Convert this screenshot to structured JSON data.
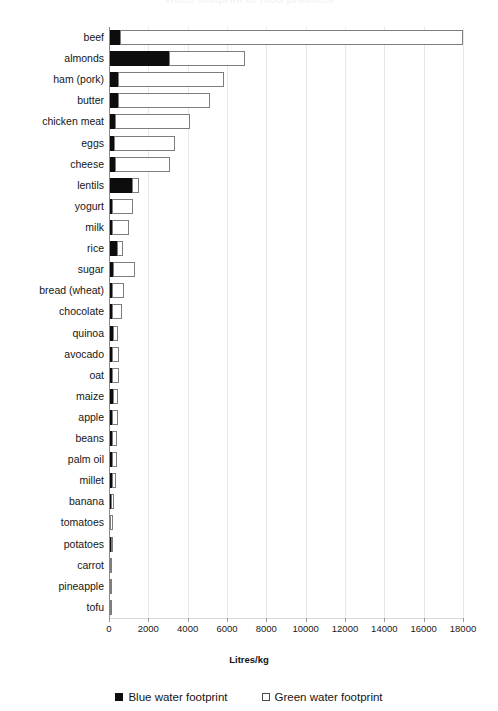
{
  "chart_data": {
    "type": "bar",
    "orientation": "horizontal",
    "stacked": true,
    "title": "Water footprint of food products",
    "xlabel": "Litres/kg",
    "ylabel": "",
    "xlim": [
      0,
      18000
    ],
    "xticks": [
      0,
      2000,
      4000,
      6000,
      8000,
      10000,
      12000,
      14000,
      16000,
      18000
    ],
    "xtick_labels": [
      "0",
      "2000",
      "4000",
      "6000",
      "8000",
      "10000",
      "12000",
      "14000",
      "16000",
      "18000"
    ],
    "grid": "vertical",
    "legend_position": "bottom",
    "categories": [
      "beef",
      "almonds",
      "ham (pork)",
      "butter",
      "chicken meat",
      "eggs",
      "cheese",
      "lentils",
      "yogurt",
      "milk",
      "rice",
      "sugar",
      "bread (wheat)",
      "chocolate",
      "quinoa",
      "avocado",
      "oat",
      "maize",
      "apple",
      "beans",
      "palm oil",
      "millet",
      "banana",
      "tomatoes",
      "potatoes",
      "carrot",
      "pineapple",
      "tofu"
    ],
    "series": [
      {
        "name": "Blue water footprint",
        "color": "#0d0d0d",
        "style": "filled",
        "values": [
          550,
          3050,
          460,
          470,
          320,
          240,
          280,
          1180,
          160,
          140,
          390,
          190,
          140,
          130,
          190,
          160,
          130,
          190,
          130,
          160,
          170,
          150,
          100,
          60,
          90,
          70,
          40,
          30
        ]
      },
      {
        "name": "Green water footprint",
        "color": "#ffffff",
        "style": "open",
        "values": [
          17450,
          3850,
          5380,
          4660,
          3790,
          3110,
          2820,
          350,
          1040,
          890,
          320,
          1110,
          620,
          520,
          290,
          360,
          390,
          270,
          330,
          250,
          230,
          210,
          180,
          150,
          100,
          100,
          90,
          70
        ]
      }
    ],
    "totals": [
      18000,
      6900,
      5840,
      5130,
      4110,
      3350,
      3100,
      1530,
      1200,
      1030,
      710,
      1300,
      760,
      650,
      480,
      520,
      520,
      460,
      460,
      410,
      400,
      360,
      280,
      210,
      190,
      170,
      130,
      100
    ]
  },
  "legend": [
    {
      "label": "Blue water footprint",
      "swatch": "filled-square-icon"
    },
    {
      "label": "Green water footprint",
      "swatch": "open-square-icon"
    }
  ]
}
